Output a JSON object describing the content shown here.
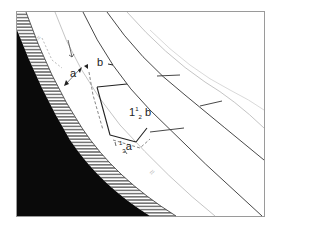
{
  "diagram": {
    "type": "cross-section schematic",
    "colors": {
      "frame": "#9a9a9a",
      "solid_region": "#0a0a0a",
      "hatch": "#222222",
      "lines": "#333333",
      "faint_lines": "#b0b0b0",
      "dashed": "#666666"
    },
    "labels": {
      "a": "a",
      "b": "b",
      "one_half_b_whole": "1",
      "one_half_b_frac": "1/2",
      "one_half_b_var": "b",
      "one_third_a_frac": "1/3",
      "one_third_a_var": "a"
    },
    "annotations": {
      "faint_mark_top": "≈",
      "faint_mark_bottom": "≈"
    }
  }
}
